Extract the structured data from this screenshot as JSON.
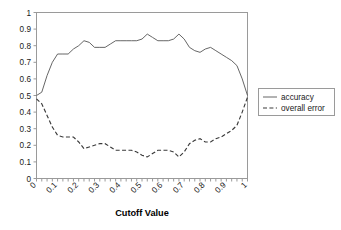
{
  "chart_data": {
    "type": "line",
    "title": "",
    "xlabel": "Cutoff Value",
    "ylabel": "",
    "xlim": [
      0,
      1
    ],
    "ylim": [
      0,
      1
    ],
    "grid": false,
    "legend_position": "right",
    "x_tick_labels": [
      "0",
      "0.1",
      "0.2",
      "0.3",
      "0.4",
      "0.5",
      "0.6",
      "0.7",
      "0.8",
      "0.9",
      "1"
    ],
    "y_tick_labels": [
      "0",
      "0.1",
      "0.2",
      "0.3",
      "0.4",
      "0.5",
      "0.6",
      "0.7",
      "0.8",
      "0.9",
      "1"
    ],
    "y_tick_values": [
      0,
      0.1,
      0.2,
      0.3,
      0.4,
      0.5,
      0.6,
      0.7,
      0.8,
      0.9,
      1
    ],
    "x": [
      0,
      0.025,
      0.05,
      0.075,
      0.1,
      0.125,
      0.15,
      0.175,
      0.2,
      0.225,
      0.25,
      0.275,
      0.3,
      0.325,
      0.35,
      0.375,
      0.4,
      0.425,
      0.45,
      0.475,
      0.5,
      0.525,
      0.55,
      0.575,
      0.6,
      0.625,
      0.65,
      0.675,
      0.7,
      0.725,
      0.75,
      0.775,
      0.8,
      0.825,
      0.85,
      0.875,
      0.9,
      0.925,
      0.95,
      0.975,
      1
    ],
    "series": [
      {
        "name": "accuracy",
        "style": "solid",
        "color": "#555555",
        "values": [
          0.5,
          0.52,
          0.62,
          0.7,
          0.75,
          0.75,
          0.75,
          0.78,
          0.8,
          0.83,
          0.82,
          0.79,
          0.79,
          0.79,
          0.81,
          0.83,
          0.83,
          0.83,
          0.83,
          0.83,
          0.84,
          0.87,
          0.85,
          0.83,
          0.83,
          0.83,
          0.84,
          0.87,
          0.84,
          0.79,
          0.77,
          0.76,
          0.78,
          0.79,
          0.77,
          0.75,
          0.73,
          0.71,
          0.68,
          0.6,
          0.5
        ]
      },
      {
        "name": "overall error",
        "style": "dashed",
        "color": "#3a3a3a",
        "values": [
          0.48,
          0.45,
          0.38,
          0.31,
          0.26,
          0.25,
          0.25,
          0.25,
          0.22,
          0.18,
          0.19,
          0.2,
          0.21,
          0.21,
          0.19,
          0.17,
          0.17,
          0.17,
          0.17,
          0.16,
          0.14,
          0.13,
          0.15,
          0.17,
          0.17,
          0.17,
          0.16,
          0.13,
          0.16,
          0.21,
          0.23,
          0.24,
          0.22,
          0.22,
          0.24,
          0.25,
          0.27,
          0.29,
          0.32,
          0.4,
          0.49
        ]
      }
    ],
    "legend_entries": [
      {
        "label": "accuracy",
        "style": "solid"
      },
      {
        "label": "overall error",
        "style": "dashed"
      }
    ]
  }
}
